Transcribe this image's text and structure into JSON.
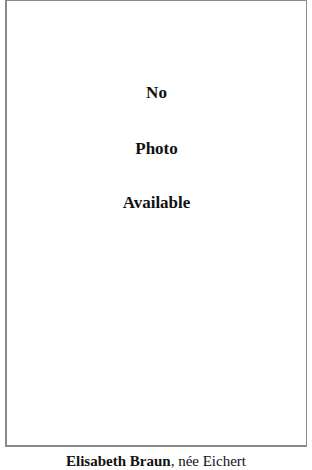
{
  "photo_placeholder": {
    "lines": [
      "No",
      "Photo",
      "Available"
    ],
    "border_color": "#8a8a8a"
  },
  "caption": {
    "name": "Elisabeth Braun",
    "separator": ",",
    "maiden_name": " née Eichert"
  }
}
